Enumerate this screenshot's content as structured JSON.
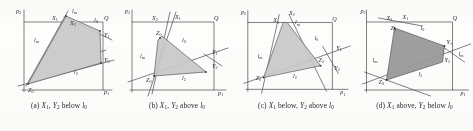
{
  "figure": {
    "panel_count": 4,
    "axis_labels": {
      "y": "p",
      "y_sub": "2",
      "x": "p",
      "x_sub": "1"
    },
    "colors": {
      "ink": "#3a3a3a",
      "fill_light": "#c9c9c9",
      "fill_dark": "#9a9a9a",
      "page": "#fdfdfc"
    }
  },
  "panels": [
    {
      "id": "a",
      "caption_tag": "(a)",
      "caption_text": "X₁, Y₂ below l₀",
      "caption_parts": {
        "tag": "(a)",
        "x": "X",
        "x_sub": "1",
        "y": "Y",
        "y_sub": "2",
        "verb": "below",
        "line": "l",
        "line_sub": "0"
      },
      "fill": "#c9c9c9",
      "labels": [
        {
          "name": "X",
          "sub": "1"
        },
        {
          "name": "X",
          "sub": "2"
        },
        {
          "name": "Y",
          "sub": "1"
        },
        {
          "name": "Y",
          "sub": "2"
        },
        {
          "name": "Z",
          "sub": "0"
        },
        {
          "name": "Q",
          "sub": ""
        },
        {
          "name": "l",
          "sub": "0"
        },
        {
          "name": "l",
          "sub": "m"
        },
        {
          "name": "l",
          "sub": "2"
        }
      ]
    },
    {
      "id": "b",
      "caption_tag": "(b)",
      "caption_text": "X₁, Y₂ above l₀",
      "caption_parts": {
        "tag": "(b)",
        "x": "X",
        "x_sub": "1",
        "y": "Y",
        "y_sub": "2",
        "verb": "above",
        "line": "l",
        "line_sub": "0"
      },
      "fill": "#c9c9c9",
      "labels": [
        {
          "name": "X",
          "sub": "1"
        },
        {
          "name": "X",
          "sub": "2"
        },
        {
          "name": "Y",
          "sub": "1"
        },
        {
          "name": "Y",
          "sub": "2"
        },
        {
          "name": "Z",
          "sub": "0"
        },
        {
          "name": "Q",
          "sub": ""
        },
        {
          "name": "l",
          "sub": "0"
        },
        {
          "name": "l",
          "sub": "m"
        },
        {
          "name": "l",
          "sub": "2"
        }
      ]
    },
    {
      "id": "c",
      "caption_tag": "(c)",
      "caption_text": "X₁ below, Y₂ above l₀",
      "caption_parts": {
        "tag": "(c)",
        "x": "X",
        "x_sub": "1",
        "verb1": "below,",
        "y": "Y",
        "y_sub": "2",
        "verb2": "above",
        "line": "l",
        "line_sub": "0"
      },
      "fill": "#c9c9c9",
      "labels": [
        {
          "name": "X",
          "sub": "1"
        },
        {
          "name": "X",
          "sub": "2"
        },
        {
          "name": "Y",
          "sub": "1"
        },
        {
          "name": "Y",
          "sub": "2"
        },
        {
          "name": "Z",
          "sub": "0"
        },
        {
          "name": "Z",
          "sub": "2"
        },
        {
          "name": "Q",
          "sub": ""
        },
        {
          "name": "l",
          "sub": "0"
        },
        {
          "name": "l",
          "sub": "m"
        },
        {
          "name": "l",
          "sub": "2"
        }
      ]
    },
    {
      "id": "d",
      "caption_tag": "(d)",
      "caption_text": "X₁ above, Y₂ below l₀",
      "caption_parts": {
        "tag": "(d)",
        "x": "X",
        "x_sub": "1",
        "verb1": "above,",
        "y": "Y",
        "y_sub": "2",
        "verb2": "below",
        "line": "l",
        "line_sub": "0"
      },
      "fill": "#9a9a9a",
      "labels": [
        {
          "name": "X",
          "sub": "1"
        },
        {
          "name": "X",
          "sub": "2"
        },
        {
          "name": "Y",
          "sub": "1"
        },
        {
          "name": "Y",
          "sub": "2"
        },
        {
          "name": "Z",
          "sub": "0"
        },
        {
          "name": "Q",
          "sub": ""
        },
        {
          "name": "l",
          "sub": "0"
        },
        {
          "name": "l",
          "sub": "m"
        },
        {
          "name": "l",
          "sub": "2"
        }
      ]
    }
  ]
}
